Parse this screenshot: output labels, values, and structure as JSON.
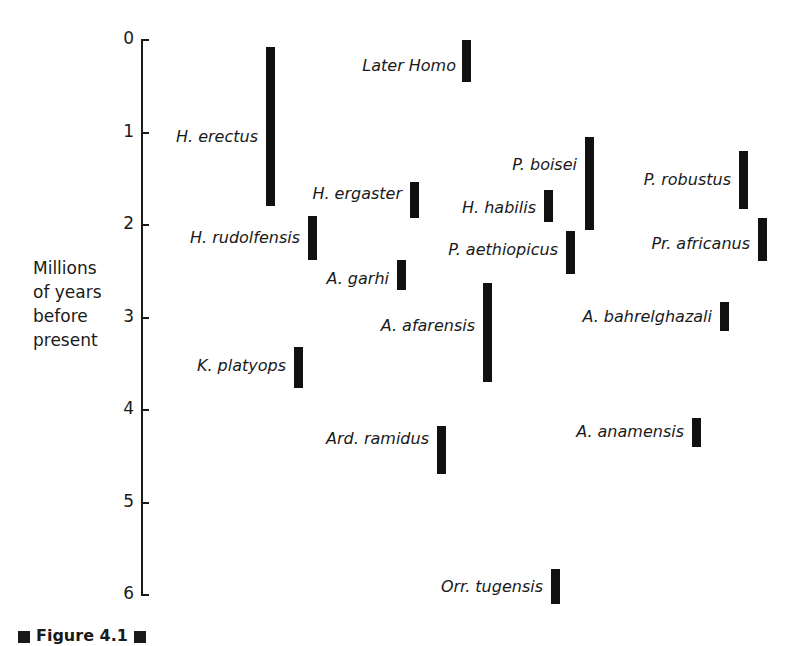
{
  "chart_data": {
    "type": "range-bar",
    "title": "",
    "ylabel": "Millions of years before present",
    "xlabel": "",
    "ylim": [
      0,
      6
    ],
    "y_inverted": true,
    "y_ticks": [
      0,
      1,
      2,
      3,
      4,
      5,
      6
    ],
    "grid": false,
    "legend": null,
    "series": [
      {
        "name": "Later Homo",
        "start": 0.0,
        "end": 0.45
      },
      {
        "name": "H. erectus",
        "start": 0.08,
        "end": 1.8
      },
      {
        "name": "H. ergaster",
        "start": 1.54,
        "end": 1.92
      },
      {
        "name": "H. rudolfensis",
        "start": 1.9,
        "end": 2.38
      },
      {
        "name": "A. garhi",
        "start": 2.38,
        "end": 2.7
      },
      {
        "name": "H. habilis",
        "start": 1.62,
        "end": 1.97
      },
      {
        "name": "P. boisei",
        "start": 1.05,
        "end": 2.05
      },
      {
        "name": "P. aethiopicus",
        "start": 2.06,
        "end": 2.53
      },
      {
        "name": "P. robustus",
        "start": 1.2,
        "end": 1.83
      },
      {
        "name": "Pr. africanus",
        "start": 1.92,
        "end": 2.39
      },
      {
        "name": "A. afarensis",
        "start": 2.63,
        "end": 3.7
      },
      {
        "name": "A. bahrelghazali",
        "start": 2.83,
        "end": 3.15
      },
      {
        "name": "K. platyops",
        "start": 3.32,
        "end": 3.76
      },
      {
        "name": "Ard. ramidus",
        "start": 4.17,
        "end": 4.69
      },
      {
        "name": "A. anamensis",
        "start": 4.09,
        "end": 4.4
      },
      {
        "name": "Orr. tugensis",
        "start": 5.72,
        "end": 6.1
      }
    ]
  },
  "axis": {
    "ylabel": "Millions\nof years\nbefore\npresent",
    "ticks": [
      "0",
      "1",
      "2",
      "3",
      "4",
      "5",
      "6"
    ]
  },
  "taxa": [
    {
      "label": "Later Homo",
      "bar_x": 462,
      "label_right": 456,
      "label_y": 56
    },
    {
      "label": "H. erectus",
      "bar_x": 266,
      "label_right": 258,
      "label_y": 127
    },
    {
      "label": "H. ergaster",
      "bar_x": 410,
      "label_right": 402,
      "label_y": 184
    },
    {
      "label": "H. rudolfensis",
      "bar_x": 308,
      "label_right": 300,
      "label_y": 228
    },
    {
      "label": "A. garhi",
      "bar_x": 397,
      "label_right": 389,
      "label_y": 269
    },
    {
      "label": "H. habilis",
      "bar_x": 544,
      "label_right": 536,
      "label_y": 198
    },
    {
      "label": "P. boisei",
      "bar_x": 585,
      "label_right": 577,
      "label_y": 155
    },
    {
      "label": "P. aethiopicus",
      "bar_x": 566,
      "label_right": 558,
      "label_y": 240
    },
    {
      "label": "P. robustus",
      "bar_x": 739,
      "label_right": 731,
      "label_y": 170
    },
    {
      "label": "Pr. africanus",
      "bar_x": 758,
      "label_right": 750,
      "label_y": 234
    },
    {
      "label": "A. afarensis",
      "bar_x": 483,
      "label_right": 475,
      "label_y": 316
    },
    {
      "label": "A. bahrelghazali",
      "bar_x": 720,
      "label_right": 712,
      "label_y": 307
    },
    {
      "label": "K. platyops",
      "bar_x": 294,
      "label_right": 286,
      "label_y": 356
    },
    {
      "label": "Ard. ramidus",
      "bar_x": 437,
      "label_right": 429,
      "label_y": 429
    },
    {
      "label": "A. anamensis",
      "bar_x": 692,
      "label_right": 684,
      "label_y": 422
    },
    {
      "label": "Orr. tugensis",
      "bar_x": 551,
      "label_right": 543,
      "label_y": 577
    }
  ],
  "caption": {
    "text": "Figure 4.1"
  },
  "colors": {
    "bar": "#111111",
    "text": "#1a1a1a",
    "background": "#ffffff"
  }
}
